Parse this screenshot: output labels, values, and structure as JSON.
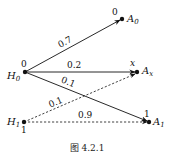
{
  "nodes": {
    "H0": {
      "name": "H",
      "sub": "0",
      "value": "0"
    },
    "H1": {
      "name": "H",
      "sub": "1",
      "value": "1"
    },
    "A0": {
      "name": "A",
      "sub": "0",
      "value": "0"
    },
    "Ax": {
      "name": "A",
      "sub": "x",
      "value": "x"
    },
    "A1": {
      "name": "A",
      "sub": "1",
      "value": "1"
    }
  },
  "edges": [
    {
      "from": "H0",
      "to": "A0",
      "label": "0.7",
      "style": "solid"
    },
    {
      "from": "H0",
      "to": "Ax",
      "label": "0.2",
      "style": "solid"
    },
    {
      "from": "H0",
      "to": "A1",
      "label": "0.1",
      "style": "solid"
    },
    {
      "from": "H1",
      "to": "Ax",
      "label": "0.1",
      "style": "dashed"
    },
    {
      "from": "H1",
      "to": "A1",
      "label": "0.9",
      "style": "dashed"
    }
  ],
  "caption": "图 4.2.1"
}
